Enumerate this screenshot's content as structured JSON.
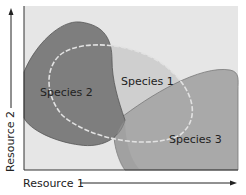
{
  "diagram": {
    "x_axis_label": "Resource 1",
    "y_axis_label": "Resource 2",
    "species": [
      {
        "name": "Species 1",
        "color": "#cfcfcf"
      },
      {
        "name": "Species 2",
        "color": "#7e7e7e"
      },
      {
        "name": "Species 3",
        "color": "#a9a9a9"
      }
    ],
    "background_color": "#e6e6e6",
    "dashed_outline_color": "#dcdcdc"
  }
}
